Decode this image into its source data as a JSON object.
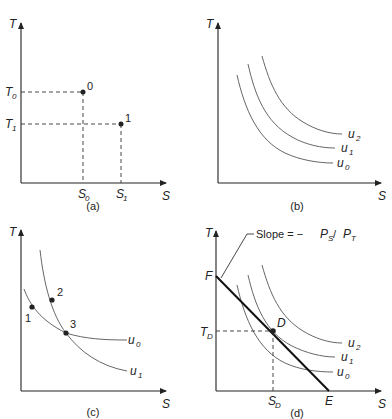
{
  "figure": {
    "panels": [
      {
        "id": "a",
        "caption": "(a)",
        "y_axis_label": "T",
        "x_axis_label": "S",
        "y_ticks": [
          {
            "base": "T",
            "sub": "0"
          },
          {
            "base": "T",
            "sub": "1"
          }
        ],
        "x_ticks": [
          {
            "base": "S",
            "sub": "0"
          },
          {
            "base": "S",
            "sub": "1"
          }
        ],
        "points": [
          {
            "label": "0",
            "s": "S0",
            "t": "T0"
          },
          {
            "label": "1",
            "s": "S1",
            "t": "T1"
          }
        ]
      },
      {
        "id": "b",
        "caption": "(b)",
        "y_axis_label": "T",
        "x_axis_label": "S",
        "curves": [
          {
            "base": "u",
            "sub": "0"
          },
          {
            "base": "u",
            "sub": "1"
          },
          {
            "base": "u",
            "sub": "2"
          }
        ]
      },
      {
        "id": "c",
        "caption": "(c)",
        "y_axis_label": "T",
        "x_axis_label": "S",
        "curves": [
          {
            "base": "u",
            "sub": "0"
          },
          {
            "base": "u",
            "sub": "1"
          }
        ],
        "points": [
          {
            "label": "1",
            "on": "u0"
          },
          {
            "label": "2",
            "on": "u1"
          },
          {
            "label": "3",
            "on": "u0 ∩ u1"
          }
        ]
      },
      {
        "id": "d",
        "caption": "(d)",
        "y_axis_label": "T",
        "x_axis_label": "S",
        "intercept_y": "F",
        "intercept_x": "E",
        "slope_label": {
          "prefix": "Slope = −",
          "num_base": "P",
          "num_sub": "S",
          "sep": " / ",
          "den_base": "P",
          "den_sub": "T"
        },
        "tangent_point": "D",
        "y_tick": {
          "base": "T",
          "sub": "D"
        },
        "x_tick": {
          "base": "S",
          "sub": "D"
        },
        "curves": [
          {
            "base": "u",
            "sub": "0"
          },
          {
            "base": "u",
            "sub": "1"
          },
          {
            "base": "u",
            "sub": "2"
          }
        ]
      }
    ]
  }
}
